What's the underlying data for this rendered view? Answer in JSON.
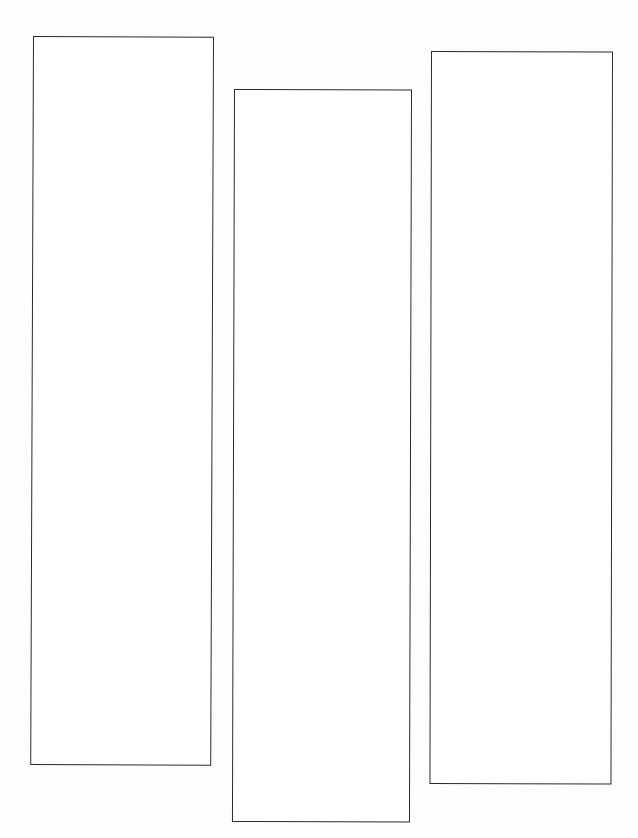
{
  "document": {
    "kind": "scanned-diagram",
    "title": "",
    "background_color": "#fdfdfd",
    "page_color": "#ffffff",
    "stroke_color": "#2b2b2b",
    "width": 638,
    "height": 838
  },
  "panels": [
    {
      "id": "panel-1",
      "label": "",
      "content": "",
      "fill": "#ffffff",
      "stroke": "#2b2b2b",
      "x": 33,
      "y": 36,
      "width": 181,
      "height": 729
    },
    {
      "id": "panel-2",
      "label": "",
      "content": "",
      "fill": "#ffffff",
      "stroke": "#2b2b2b",
      "x": 234,
      "y": 89,
      "width": 178,
      "height": 733
    },
    {
      "id": "panel-3",
      "label": "",
      "content": "",
      "fill": "#ffffff",
      "stroke": "#2b2b2b",
      "x": 431,
      "y": 51,
      "width": 182,
      "height": 733
    }
  ]
}
